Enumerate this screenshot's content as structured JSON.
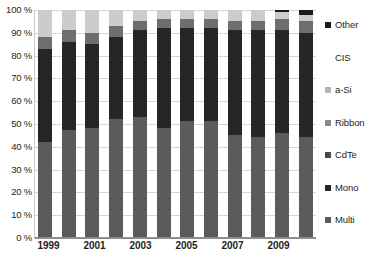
{
  "chart_data": {
    "type": "bar",
    "subtype": "stacked-percentage",
    "title": "",
    "xlabel": "",
    "ylabel": "",
    "ylim": [
      0,
      100
    ],
    "ytick_format": "0 %",
    "grid": true,
    "legend_position": "right",
    "categories": [
      "1999",
      "2000",
      "2001",
      "2002",
      "2003",
      "2004",
      "2005",
      "2006",
      "2007",
      "2008",
      "2009",
      "2010"
    ],
    "xtick_labels": [
      "1999",
      "2001",
      "2003",
      "2005",
      "2007",
      "2009"
    ],
    "yticks": [
      "0 %",
      "10 %",
      "20 %",
      "30 %",
      "40 %",
      "50 %",
      "60 %",
      "70 %",
      "80 %",
      "90 %",
      "100 %"
    ],
    "series": [
      {
        "name": "Multi",
        "color": "#5b5b5b",
        "values": [
          42,
          47,
          48,
          52,
          53,
          48,
          51,
          51,
          45,
          44,
          46,
          44
        ]
      },
      {
        "name": "Mono",
        "color": "#262626",
        "values": [
          41,
          39,
          37,
          36,
          38,
          44,
          41,
          41,
          46,
          47,
          45,
          46
        ]
      },
      {
        "name": "CdTe",
        "color": "#3f3f3f",
        "values": [
          0,
          0,
          0,
          0,
          0,
          0,
          0,
          0,
          0,
          0,
          0,
          0
        ]
      },
      {
        "name": "Ribbon",
        "color": "#8a8a8a",
        "values": [
          0,
          0,
          0,
          0,
          0,
          0,
          0,
          0,
          0,
          0,
          0,
          0
        ]
      },
      {
        "name": "a-Si",
        "color": "#6e6e6e",
        "values": [
          5,
          5,
          5,
          5,
          4,
          4,
          4,
          4,
          4,
          4,
          5,
          5
        ]
      },
      {
        "name": "CIS",
        "color": "#cccccc",
        "values": [
          12,
          9,
          10,
          7,
          5,
          4,
          4,
          4,
          5,
          5,
          3,
          3
        ]
      },
      {
        "name": "Other",
        "color": "#1a1a1a",
        "values": [
          0,
          0,
          0,
          0,
          0,
          0,
          0,
          0,
          0,
          0,
          1,
          2
        ]
      }
    ]
  },
  "legend": {
    "items": [
      {
        "label": "Other",
        "color": "#1a1a1a"
      },
      {
        "label": "CIS",
        "color": "#ffffff"
      },
      {
        "label": "a-Si",
        "color": "#b6b6b6"
      },
      {
        "label": "Ribbon",
        "color": "#8a8a8a"
      },
      {
        "label": "CdTe",
        "color": "#4a4a4a"
      },
      {
        "label": "Mono",
        "color": "#262626"
      },
      {
        "label": "Multi",
        "color": "#5b5b5b"
      }
    ]
  },
  "colors": {
    "background": "#ffffff",
    "text": "#231f20",
    "gridline": "#d5d5d5",
    "axis": "#8d8d8d"
  }
}
